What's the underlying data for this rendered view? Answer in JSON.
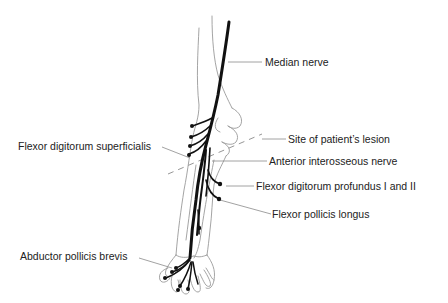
{
  "diagram": {
    "type": "anatomical-illustration",
    "labels": {
      "median_nerve": "Median nerve",
      "site_of_lesion": "Site of patient’s lesion",
      "flexor_digitorum_superficialis": "Flexor digitorum superficialis",
      "anterior_interosseous_nerve": "Anterior interosseous nerve",
      "flexor_digitorum_profundus": "Flexor digitorum profundus I and II",
      "flexor_pollicis_longus": "Flexor pollicis longus",
      "abductor_pollicis_brevis": "Abductor pollicis brevis"
    },
    "colors": {
      "nerve": "#111111",
      "outline": "#9a9a9a",
      "leader": "#8a8a8a",
      "text": "#222222",
      "background": "#ffffff"
    }
  }
}
